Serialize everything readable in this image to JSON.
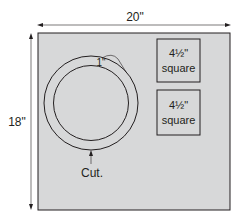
{
  "diagram": {
    "width_label": "20\"",
    "height_label": "18\"",
    "ring_width_label": "1\"",
    "cut_label": "Cut.",
    "squares": [
      {
        "size_label": "4½\"",
        "name_label": "square"
      },
      {
        "size_label": "4½\"",
        "name_label": "square"
      }
    ],
    "colors": {
      "fabric": "#d7d8d9",
      "stroke": "#231f20"
    }
  }
}
